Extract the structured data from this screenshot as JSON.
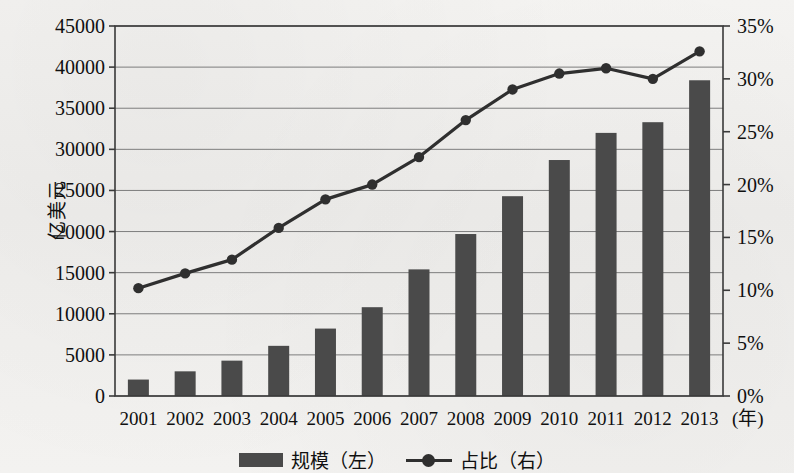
{
  "chart_data": {
    "type": "bar",
    "title": "",
    "subtitle": "",
    "xlabel": "(年)",
    "ylabel": "亿美元",
    "y2label": "",
    "categories": [
      "2001",
      "2002",
      "2003",
      "2004",
      "2005",
      "2006",
      "2007",
      "2008",
      "2009",
      "2010",
      "2011",
      "2012",
      "2013"
    ],
    "series": [
      {
        "name": "规模（左）",
        "type": "bar",
        "axis": "left",
        "unit": "亿美元",
        "color": "#4a4a4a",
        "values": [
          2000,
          3000,
          4300,
          6100,
          8200,
          10800,
          15400,
          19700,
          24300,
          28700,
          32000,
          33300,
          38400
        ]
      },
      {
        "name": "占比（右）",
        "type": "line",
        "axis": "right",
        "unit": "%",
        "color": "#2f2f2f",
        "values": [
          10.2,
          11.6,
          12.9,
          15.9,
          18.6,
          20.0,
          22.6,
          26.1,
          29.0,
          30.5,
          31.0,
          30.0,
          32.6
        ]
      }
    ],
    "y_left": {
      "ticks": [
        "0",
        "5000",
        "10000",
        "15000",
        "20000",
        "25000",
        "30000",
        "35000",
        "40000",
        "45000"
      ],
      "tick_values": [
        0,
        5000,
        10000,
        15000,
        20000,
        25000,
        30000,
        35000,
        40000,
        45000
      ],
      "min": 0,
      "max": 45000
    },
    "y_right": {
      "ticks": [
        "0%",
        "5%",
        "10%",
        "15%",
        "20%",
        "25%",
        "30%",
        "35%"
      ],
      "tick_values": [
        0,
        5,
        10,
        15,
        20,
        25,
        30,
        35
      ],
      "min": 0,
      "max": 35
    },
    "grid": true,
    "legend_position": "bottom-center"
  }
}
